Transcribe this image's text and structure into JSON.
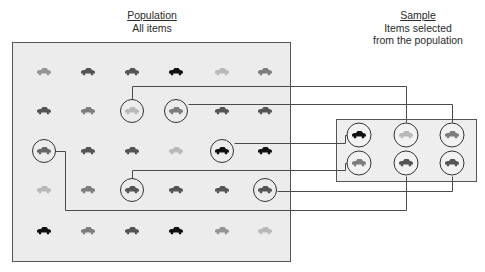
{
  "population": {
    "heading": "Population",
    "subtitle": "All items",
    "box": {
      "x": 12,
      "y": 42,
      "w": 278,
      "h": 219
    },
    "columns_x": [
      44,
      88,
      132,
      176,
      222,
      265
    ],
    "rows_y": [
      72,
      111,
      151,
      190,
      231
    ],
    "grid": [
      [
        "medium-light",
        "dark-gray",
        "dark-gray",
        "black",
        "light",
        "medium"
      ],
      [
        "dark-gray",
        "medium",
        "light",
        "medium",
        "dark-gray",
        "dark-gray"
      ],
      [
        "medium-dark",
        "dark-gray",
        "dark-gray",
        "light",
        "black",
        "black"
      ],
      [
        "light",
        "medium",
        "dark-gray",
        "dark-gray",
        "dark-gray",
        "dark-gray"
      ],
      [
        "black",
        "medium",
        "dark-gray",
        "black",
        "medium-light",
        "light"
      ]
    ],
    "selected": [
      [
        1,
        2
      ],
      [
        1,
        3
      ],
      [
        2,
        0
      ],
      [
        2,
        4
      ],
      [
        3,
        2
      ],
      [
        3,
        5
      ]
    ]
  },
  "sample": {
    "heading": "Sample",
    "subtitle_line1": "Items selected",
    "subtitle_line2": "from the population",
    "box": {
      "x": 336,
      "y": 119,
      "w": 140,
      "h": 62
    },
    "columns_x": [
      359,
      406,
      452
    ],
    "rows_y": [
      135,
      163
    ],
    "grid": [
      [
        "black",
        "light",
        "medium"
      ],
      [
        "medium",
        "dark-gray",
        "dark-gray"
      ]
    ]
  },
  "colors": {
    "black": "#111111",
    "dark-gray": "#555555",
    "medium-dark": "#666666",
    "medium": "#7d7d7d",
    "medium-light": "#959595",
    "light": "#b8b8b8",
    "population_fill": "#ececec",
    "sample_fill": "#eeeeee",
    "line": "#4a4a4a"
  },
  "connections": [
    {
      "from": [
        1,
        2
      ],
      "to": [
        0,
        1
      ],
      "points": [
        [
          132,
          99
        ],
        [
          132,
          86
        ],
        [
          406,
          86
        ],
        [
          406,
          122
        ]
      ]
    },
    {
      "from": [
        1,
        3
      ],
      "to": [
        0,
        2
      ],
      "points": [
        [
          188,
          104
        ],
        [
          452,
          104
        ],
        [
          452,
          122
        ]
      ]
    },
    {
      "from": [
        2,
        4
      ],
      "to": [
        0,
        0
      ],
      "points": [
        [
          234,
          143
        ],
        [
          345,
          143
        ],
        [
          345,
          135
        ],
        [
          347,
          135
        ]
      ]
    },
    {
      "from": [
        2,
        0
      ],
      "to": [
        1,
        1
      ],
      "points": [
        [
          55,
          151
        ],
        [
          65,
          151
        ],
        [
          65,
          210
        ],
        [
          406,
          210
        ],
        [
          406,
          176
        ]
      ]
    },
    {
      "from": [
        3,
        2
      ],
      "to": [
        1,
        0
      ],
      "points": [
        [
          132,
          178
        ],
        [
          132,
          170
        ],
        [
          345,
          170
        ],
        [
          345,
          163
        ],
        [
          347,
          163
        ]
      ]
    },
    {
      "from": [
        3,
        5
      ],
      "to": [
        1,
        2
      ],
      "points": [
        [
          277,
          191
        ],
        [
          452,
          191
        ],
        [
          452,
          176
        ]
      ]
    }
  ]
}
